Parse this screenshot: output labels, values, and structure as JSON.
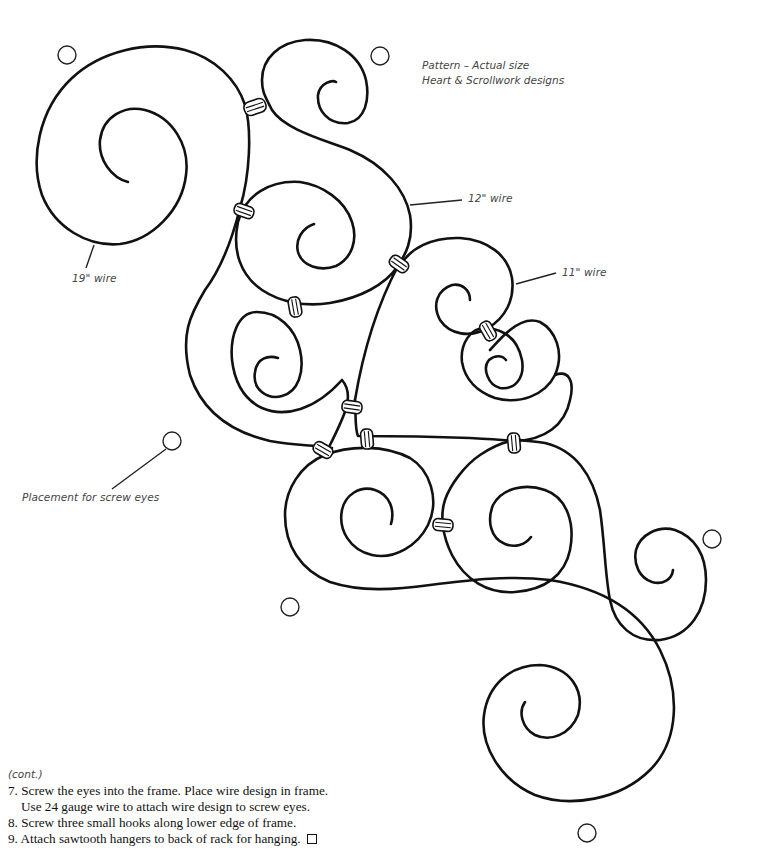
{
  "title": {
    "line1": "Pattern – Actual size",
    "line2": "Heart & Scrollwork designs"
  },
  "labels": {
    "wire_19": "19\" wire",
    "wire_12": "12\" wire",
    "wire_11": "11\" wire",
    "screw_eyes": "Placement for screw eyes"
  },
  "instructions": {
    "cont": "(cont.)",
    "steps": [
      {
        "num": "7.",
        "text": "Screw the eyes into the frame. Place wire design in frame.",
        "continuation": "Use 24 gauge wire to attach wire design to screw eyes."
      },
      {
        "num": "8.",
        "text": "Screw three small hooks along lower edge of frame."
      },
      {
        "num": "9.",
        "text": "Attach sawtooth hangers to back of rack for hanging."
      }
    ],
    "end_mark": "box-icon"
  },
  "screw_eyes": [
    {
      "x": 67,
      "y": 55
    },
    {
      "x": 380,
      "y": 56
    },
    {
      "x": 172,
      "y": 441
    },
    {
      "x": 290,
      "y": 607
    },
    {
      "x": 712,
      "y": 539
    },
    {
      "x": 587,
      "y": 833
    }
  ],
  "colors": {
    "wire": "#111111",
    "label": "#444444",
    "background": "#ffffff"
  }
}
